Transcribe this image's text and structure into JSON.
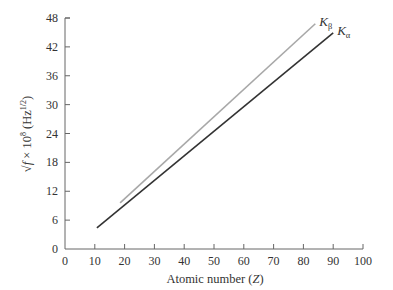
{
  "chart_data": {
    "type": "line",
    "title": "",
    "xlabel": "Atomic number (Z)",
    "xlabel_parts": {
      "text": "Atomic number (",
      "var": "Z",
      "close": ")"
    },
    "ylabel": "√f × 10^8 (Hz^1/2)",
    "ylabel_parts": {
      "root": "√f",
      "times": " × 10",
      "exp": "8",
      "unit_open": " (Hz",
      "unit_exp": "1/2",
      "unit_close": ")"
    },
    "xlim": [
      0,
      100
    ],
    "ylim": [
      0,
      48
    ],
    "xticks": [
      0,
      10,
      20,
      30,
      40,
      50,
      60,
      70,
      80,
      90,
      100
    ],
    "yticks": [
      0,
      6,
      12,
      18,
      24,
      30,
      36,
      42,
      48
    ],
    "grid": false,
    "legend": "inline labels at line ends",
    "series": [
      {
        "name": "Kβ",
        "label_main": "K",
        "label_sub": "β",
        "color": "#a8a8a8",
        "x": [
          18.5,
          84
        ],
        "y": [
          9.6,
          46.8
        ]
      },
      {
        "name": "Kα",
        "label_main": "K",
        "label_sub": "α",
        "color": "#333333",
        "x": [
          10.7,
          90
        ],
        "y": [
          4.4,
          44.9
        ]
      }
    ]
  }
}
